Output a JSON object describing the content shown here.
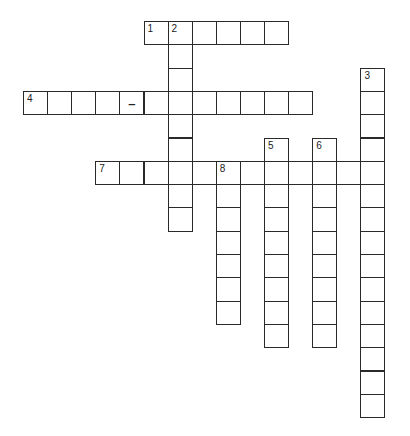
{
  "puzzle": {
    "type": "crossword",
    "cell_width": 24.1,
    "cell_height": 23.3,
    "origin_x": 23,
    "origin_y": 21,
    "line_color": "#2a2a2a",
    "entries": [
      {
        "number": "1",
        "direction": "across",
        "col": 5,
        "row": 0,
        "length": 6
      },
      {
        "number": "2",
        "direction": "down",
        "col": 6,
        "row": 0,
        "length": 9
      },
      {
        "number": "3",
        "direction": "down",
        "col": 14,
        "row": 2,
        "length": 15
      },
      {
        "number": "4",
        "direction": "across",
        "col": 0,
        "row": 3,
        "length": 12
      },
      {
        "number": "5",
        "direction": "down",
        "col": 10,
        "row": 5,
        "length": 9
      },
      {
        "number": "6",
        "direction": "down",
        "col": 12,
        "row": 5,
        "length": 9
      },
      {
        "number": "7",
        "direction": "across",
        "col": 3,
        "row": 6,
        "length": 12
      },
      {
        "number": "8",
        "direction": "down",
        "col": 8,
        "row": 6,
        "length": 7
      }
    ],
    "prefilled": [
      {
        "col": 4,
        "row": 3,
        "text": "–"
      }
    ]
  }
}
